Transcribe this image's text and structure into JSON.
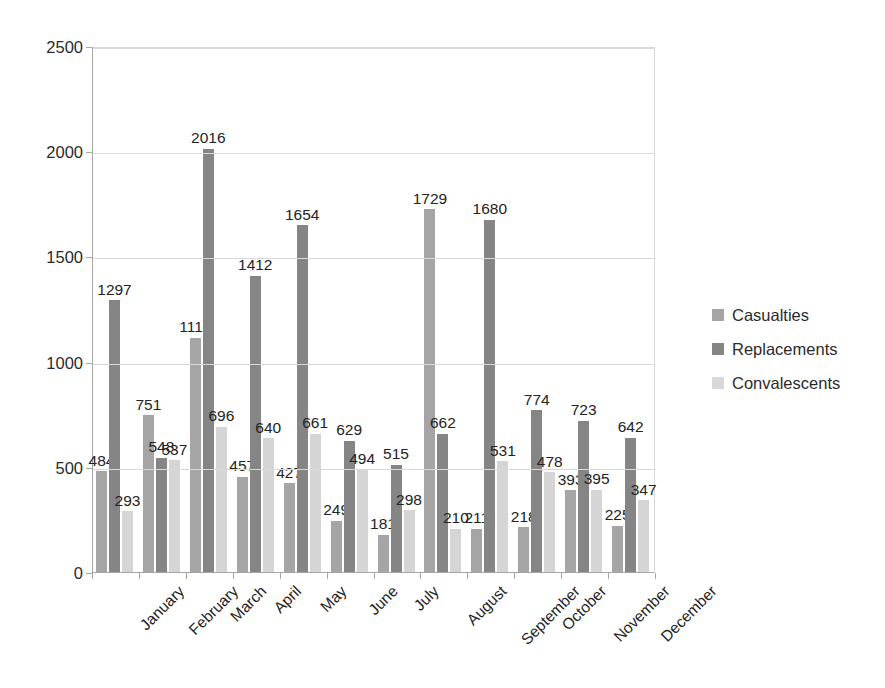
{
  "chart_data": {
    "type": "bar",
    "title": "",
    "xlabel": "",
    "ylabel": "",
    "ylim": [
      0,
      2500
    ],
    "yticks": [
      0,
      500,
      1000,
      1500,
      2000,
      2500
    ],
    "grid": true,
    "legend_position": "right",
    "categories": [
      "January",
      "February",
      "March",
      "April",
      "May",
      "June",
      "July",
      "August",
      "September",
      "October",
      "November",
      "December"
    ],
    "series": [
      {
        "name": "Casualties",
        "color": "#a5a5a5",
        "values": [
          484,
          751,
          1119,
          457,
          427,
          249,
          181,
          1729,
          211,
          218,
          393,
          225
        ]
      },
      {
        "name": "Replacements",
        "color": "#858585",
        "values": [
          1297,
          548,
          2016,
          1412,
          1654,
          629,
          515,
          662,
          1680,
          774,
          723,
          642
        ]
      },
      {
        "name": "Convalescents",
        "color": "#d8d8d8",
        "values": [
          293,
          537,
          696,
          640,
          661,
          494,
          298,
          210,
          531,
          478,
          395,
          347
        ]
      }
    ]
  },
  "legend": {
    "items": [
      {
        "label": "Casualties"
      },
      {
        "label": "Replacements"
      },
      {
        "label": "Convalescents"
      }
    ]
  },
  "caption": ""
}
